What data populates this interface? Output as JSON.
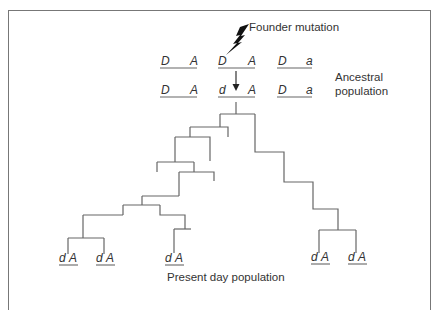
{
  "diagram": {
    "title_labels": {
      "founder_mutation": "Founder mutation",
      "ancestral_line1": "Ancestral",
      "ancestral_line2": "population",
      "present_day": "Present day population"
    },
    "ancestral_row_before": [
      {
        "left": "D",
        "right": "A"
      },
      {
        "left": "D",
        "right": "A"
      },
      {
        "left": "D",
        "right": "a"
      }
    ],
    "ancestral_row_after": [
      {
        "left": "D",
        "right": "A"
      },
      {
        "left": "d",
        "right": "A"
      },
      {
        "left": "D",
        "right": "a"
      }
    ],
    "present_day_haplotypes": [
      {
        "left": "d",
        "right": "A"
      },
      {
        "left": "d",
        "right": "A"
      },
      {
        "left": "d",
        "right": "A"
      },
      {
        "left": "d",
        "right": "A"
      },
      {
        "left": "d",
        "right": "A"
      }
    ],
    "icons": {
      "mutation": "lightning-bolt-icon",
      "descent": "arrow-down-icon"
    }
  }
}
